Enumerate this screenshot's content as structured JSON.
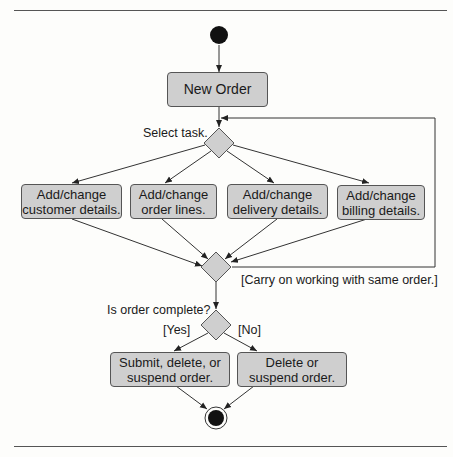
{
  "diagram": {
    "type": "UML activity diagram",
    "start_node": "initial-node",
    "end_node": "final-node",
    "activities": {
      "new_order": "New Order",
      "customer": "Add/change\ncustomer details.",
      "order_lines": "Add/change\norder lines.",
      "delivery": "Add/change\ndelivery details.",
      "billing": "Add/change\nbilling details.",
      "submit": "Submit, delete, or\nsuspend order.",
      "delete": "Delete or\nsuspend order."
    },
    "labels": {
      "select_task": "Select task.",
      "carry_on": "[Carry on working with same order.]",
      "is_complete": "Is order complete?",
      "yes": "[Yes]",
      "no": "[No]"
    },
    "colors": {
      "activity_fill": "#cfcfcf",
      "node_fill": "#111111",
      "line": "#333333"
    }
  }
}
